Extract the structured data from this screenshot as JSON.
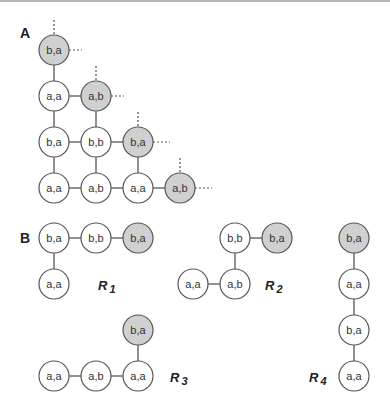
{
  "colors": {
    "highlight": "#d0d0d0",
    "plain": "#ffffff",
    "stroke": "#555555"
  },
  "panel_a": {
    "label": "A",
    "nodes": [
      {
        "id": "a1",
        "text": "b,a",
        "x": 54,
        "y": 50,
        "hl": true
      },
      {
        "id": "a2",
        "text": "a,a",
        "x": 54,
        "y": 96,
        "hl": false
      },
      {
        "id": "a3",
        "text": "a,b",
        "x": 96,
        "y": 96,
        "hl": true
      },
      {
        "id": "a4",
        "text": "b,a",
        "x": 54,
        "y": 142,
        "hl": false
      },
      {
        "id": "a5",
        "text": "b,b",
        "x": 96,
        "y": 142,
        "hl": false
      },
      {
        "id": "a6",
        "text": "b,a",
        "x": 138,
        "y": 142,
        "hl": true
      },
      {
        "id": "a7",
        "text": "a,a",
        "x": 54,
        "y": 188,
        "hl": false
      },
      {
        "id": "a8",
        "text": "a,b",
        "x": 96,
        "y": 188,
        "hl": false
      },
      {
        "id": "a9",
        "text": "a,a",
        "x": 138,
        "y": 188,
        "hl": false
      },
      {
        "id": "a10",
        "text": "a,b",
        "x": 180,
        "y": 188,
        "hl": true
      }
    ]
  },
  "panel_b": {
    "label": "B",
    "graphs": [
      {
        "name": "R",
        "sub": "1",
        "nodes": [
          {
            "text": "b,a",
            "x": 54,
            "y": 238,
            "hl": false
          },
          {
            "text": "b,b",
            "x": 96,
            "y": 238,
            "hl": false
          },
          {
            "text": "b,a",
            "x": 138,
            "y": 238,
            "hl": true
          },
          {
            "text": "a,a",
            "x": 54,
            "y": 284,
            "hl": false
          }
        ]
      },
      {
        "name": "R",
        "sub": "2",
        "nodes": [
          {
            "text": "b,b",
            "x": 235,
            "y": 238,
            "hl": false
          },
          {
            "text": "b,a",
            "x": 277,
            "y": 238,
            "hl": true
          },
          {
            "text": "a,b",
            "x": 235,
            "y": 284,
            "hl": false
          },
          {
            "text": "a,a",
            "x": 193,
            "y": 284,
            "hl": false
          }
        ]
      },
      {
        "name": "R",
        "sub": "3",
        "nodes": [
          {
            "text": "b,a",
            "x": 138,
            "y": 330,
            "hl": true
          },
          {
            "text": "a,a",
            "x": 138,
            "y": 376,
            "hl": false
          },
          {
            "text": "a,b",
            "x": 96,
            "y": 376,
            "hl": false
          },
          {
            "text": "a,a",
            "x": 54,
            "y": 376,
            "hl": false
          }
        ]
      },
      {
        "name": "R",
        "sub": "4",
        "nodes": [
          {
            "text": "b,a",
            "x": 354,
            "y": 238,
            "hl": true
          },
          {
            "text": "a,a",
            "x": 354,
            "y": 284,
            "hl": false
          },
          {
            "text": "b,a",
            "x": 354,
            "y": 330,
            "hl": false
          },
          {
            "text": "a,a",
            "x": 354,
            "y": 376,
            "hl": false
          }
        ]
      }
    ]
  }
}
